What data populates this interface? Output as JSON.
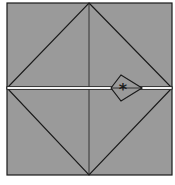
{
  "diagram": {
    "type": "fold-diagram",
    "colors": {
      "background": "#ffffff",
      "paper": "#9a9a9a",
      "line": "#1a1a1a",
      "crease_highlight": "#f4f4f4"
    },
    "square": {
      "x": 7,
      "y": 3,
      "width": 165,
      "height": 172
    },
    "vertical_center_line": {
      "x": 89
    },
    "horizontal_fold_line": {
      "y": 88
    },
    "diamond": {
      "top": [
        89,
        3
      ],
      "right": [
        172,
        88
      ],
      "bottom": [
        89,
        175
      ],
      "left": [
        7,
        88
      ]
    },
    "kite": {
      "left": [
        111,
        88
      ],
      "top": [
        121,
        75
      ],
      "right": [
        142,
        88
      ],
      "bottom": [
        121,
        101
      ]
    },
    "marker": {
      "symbol": "*",
      "x": 123,
      "y": 88
    }
  }
}
